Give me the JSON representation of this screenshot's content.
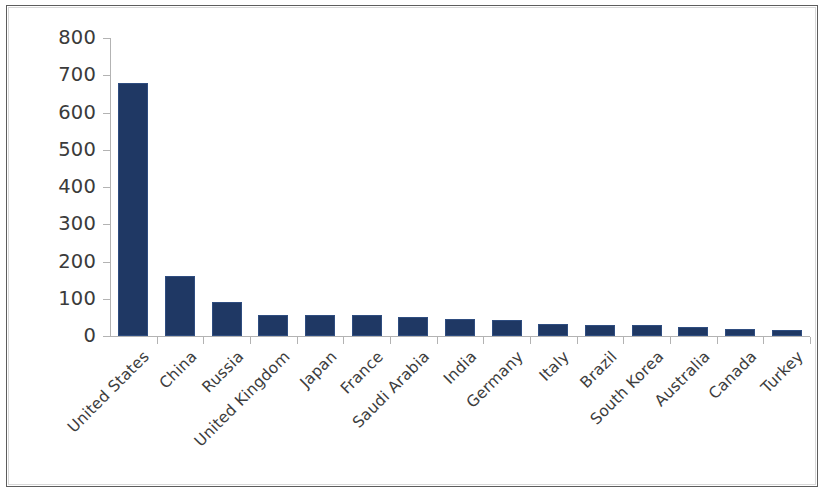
{
  "chart_data": {
    "type": "bar",
    "title": "",
    "subtitle": "",
    "xlabel": "",
    "ylabel": "",
    "ylim": [
      0,
      800
    ],
    "y_ticks": [
      0,
      100,
      200,
      300,
      400,
      500,
      600,
      700,
      800
    ],
    "y_tick_labels": [
      "0",
      "100",
      "200",
      "300",
      "400",
      "500",
      "600",
      "700",
      "800"
    ],
    "grid": false,
    "legend": false,
    "legend_position": "none",
    "bar_color": "#1f3864",
    "axis_color": "#b3b3b3",
    "categories": [
      "United States",
      "China",
      "Russia",
      "United Kingdom",
      "Japan",
      "France",
      "Saudi Arabia",
      "India",
      "Germany",
      "Italy",
      "Brazil",
      "South Korea",
      "Australia",
      "Canada",
      "Turkey"
    ],
    "values": [
      680,
      160,
      90,
      57,
      57,
      57,
      52,
      45,
      44,
      33,
      29,
      29,
      23,
      20,
      15
    ],
    "series": [
      {
        "name": "Military expenditure",
        "values": [
          680,
          160,
          90,
          57,
          57,
          57,
          52,
          45,
          44,
          33,
          29,
          29,
          23,
          20,
          15
        ]
      }
    ]
  }
}
